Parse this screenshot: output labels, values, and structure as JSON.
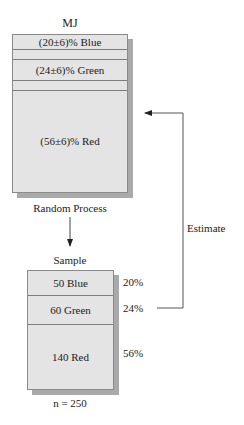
{
  "population": {
    "title": "MJ",
    "rows": [
      {
        "label": "(20±6)%  Blue"
      },
      {
        "label": ""
      },
      {
        "label": "(24±6)%  Green"
      },
      {
        "label": ""
      },
      {
        "label": "(56±6)%  Red"
      }
    ],
    "caption": "Random Process"
  },
  "sample": {
    "title": "Sample",
    "rows": [
      {
        "label": "50 Blue",
        "percent": "20%"
      },
      {
        "label": "60 Green",
        "percent": "24%"
      },
      {
        "label": "140 Red",
        "percent": "56%"
      }
    ],
    "caption": "n = 250"
  },
  "feedback": {
    "label": "Estimate"
  },
  "colors": {
    "box_fill": "#e4e4e4",
    "box_border": "#8a8a8a",
    "shadow": "#a9a9a9",
    "line": "#555555"
  }
}
